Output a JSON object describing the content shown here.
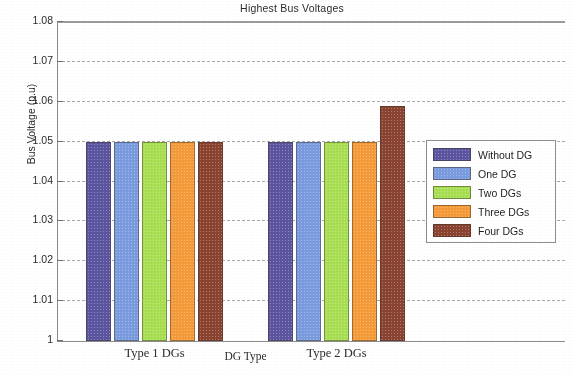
{
  "chart_data": {
    "type": "bar",
    "title": "Highest Bus Voltages",
    "xlabel": "DG Type",
    "ylabel": "Bus Voltage (p.u)",
    "categories": [
      "Type 1 DGs",
      "Type 2 DGs"
    ],
    "ylim": [
      1,
      1.08
    ],
    "ytick_labels": [
      "1",
      "1.01",
      "1.02",
      "1.03",
      "1.04",
      "1.05",
      "1.06",
      "1.07",
      "1.08"
    ],
    "ytick_values": [
      1,
      1.01,
      1.02,
      1.03,
      1.04,
      1.05,
      1.06,
      1.07,
      1.08
    ],
    "grid": true,
    "grid_style": "dashed",
    "legend_position": "right-middle",
    "series": [
      {
        "name": "Without DG",
        "color": "#5b55a0",
        "values": [
          1.05,
          1.05
        ]
      },
      {
        "name": "One DG",
        "color": "#7a9bdd",
        "values": [
          1.05,
          1.05
        ]
      },
      {
        "name": "Two DGs",
        "color": "#a8de52",
        "values": [
          1.05,
          1.05
        ]
      },
      {
        "name": "Three DGs",
        "color": "#f59a38",
        "values": [
          1.05,
          1.05
        ]
      },
      {
        "name": "Four DGs",
        "color": "#8a4330",
        "values": [
          1.05,
          1.059
        ]
      }
    ]
  }
}
